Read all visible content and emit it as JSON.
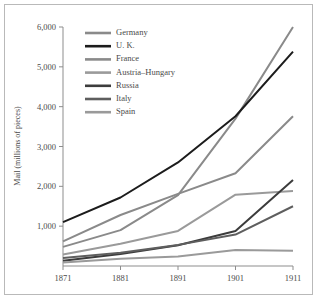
{
  "chart_data": {
    "type": "line",
    "title": "",
    "xlabel": "",
    "ylabel": "Mail (millions of pieces)",
    "x": [
      1871,
      1881,
      1891,
      1901,
      1911
    ],
    "xticklabels": [
      "1871",
      "1881",
      "1891",
      "1901",
      "1911"
    ],
    "yticklabels": [
      "1,000",
      "2,000",
      "3,000",
      "4,000",
      "5,000",
      "6,000"
    ],
    "yticks": [
      1000,
      2000,
      3000,
      4000,
      5000,
      6000
    ],
    "xlim": [
      1871,
      1911
    ],
    "ylim": [
      0,
      6000
    ],
    "grid": false,
    "legend_position": "upper-left",
    "series": [
      {
        "name": "Germany",
        "color": "#8a8a8a",
        "width": 2.0,
        "values": [
          480,
          900,
          1780,
          3700,
          6000
        ]
      },
      {
        "name": "U. K.",
        "color": "#1c1c1c",
        "width": 2.0,
        "values": [
          1100,
          1720,
          2600,
          3760,
          5380
        ]
      },
      {
        "name": "France",
        "color": "#8a8a8a",
        "width": 2.0,
        "values": [
          620,
          1280,
          1810,
          2330,
          3760
        ]
      },
      {
        "name": "Austria–Hungary",
        "color": "#9a9a9a",
        "width": 2.0,
        "values": [
          290,
          560,
          880,
          1790,
          1880
        ]
      },
      {
        "name": "Russia",
        "color": "#3c3c3c",
        "width": 2.0,
        "values": [
          130,
          300,
          520,
          880,
          2160
        ]
      },
      {
        "name": "Italy",
        "color": "#5e5e5e",
        "width": 2.0,
        "values": [
          200,
          330,
          530,
          790,
          1500
        ]
      },
      {
        "name": "Spain",
        "color": "#9a9a9a",
        "width": 2.0,
        "values": [
          90,
          180,
          240,
          400,
          380
        ]
      }
    ]
  }
}
